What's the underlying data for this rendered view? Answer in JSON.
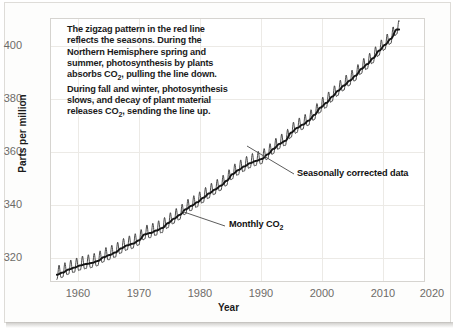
{
  "chart_data": {
    "type": "line",
    "title": "",
    "xlabel": "Year",
    "ylabel": "Parts per million",
    "xlim": [
      1957,
      2021
    ],
    "ylim": [
      312,
      408
    ],
    "xticks": [
      "1960",
      "1970",
      "1980",
      "1990",
      "2000",
      "2010",
      "2020"
    ],
    "yticks": [
      "320",
      "340",
      "360",
      "380",
      "400"
    ],
    "grid": true,
    "legend_position": "inline-annotations",
    "series": [
      {
        "name": "Monthly CO2",
        "description": "Monthly mean atmospheric CO2 with seasonal zigzag",
        "seasonal_amplitude_ppm": 6.5
      },
      {
        "name": "Seasonally corrected data",
        "description": "Seasonally adjusted trend line",
        "x": [
          1958,
          1959,
          1960,
          1961,
          1962,
          1963,
          1964,
          1965,
          1966,
          1967,
          1968,
          1969,
          1970,
          1971,
          1972,
          1973,
          1974,
          1975,
          1976,
          1977,
          1978,
          1979,
          1980,
          1981,
          1982,
          1983,
          1984,
          1985,
          1986,
          1987,
          1988,
          1989,
          1990,
          1991,
          1992,
          1993,
          1994,
          1995,
          1996,
          1997,
          1998,
          1999,
          2000,
          2001,
          2002,
          2003,
          2004,
          2005,
          2006,
          2007,
          2008,
          2009,
          2010,
          2011,
          2012,
          2013,
          2014,
          2015,
          2016
        ],
        "values": [
          315.0,
          315.8,
          316.9,
          317.6,
          318.4,
          318.9,
          319.3,
          320.0,
          321.4,
          322.2,
          323.1,
          324.6,
          325.7,
          326.3,
          327.5,
          329.7,
          330.2,
          331.1,
          332.0,
          333.8,
          335.4,
          336.8,
          338.8,
          340.1,
          341.4,
          343.0,
          344.6,
          346.0,
          347.4,
          349.2,
          351.6,
          353.1,
          354.4,
          355.6,
          356.4,
          357.1,
          358.8,
          360.8,
          362.6,
          363.7,
          366.7,
          368.4,
          369.6,
          371.1,
          373.2,
          375.8,
          377.5,
          379.8,
          381.9,
          383.8,
          385.6,
          387.4,
          389.9,
          391.6,
          393.8,
          396.5,
          398.6,
          400.8,
          404.2
        ]
      }
    ],
    "annotations": {
      "note": "The zigzag pattern in the red line reflects the seasons. During the Northern Hemisphere spring and summer, photosynthesis by plants absorbs CO₂, pulling the line down. During fall and winter, photosynthesis slows, and decay of plant material releases CO₂, sending the line up.",
      "seasonal_label": "Seasonally corrected data",
      "monthly_label_prefix": "Monthly CO",
      "monthly_label_sub": "2"
    }
  },
  "note_lines": [
    "The zigzag pattern in the red line",
    "reflects the seasons. During the",
    "Northern Hemisphere spring and",
    "summer, photosynthesis by plants",
    "absorbs CO₂, pulling the line down.",
    "During fall and winter, photosynthesis",
    "slows, and decay of plant material",
    "releases CO₂, sending the line up."
  ],
  "colors": {
    "monthly_line": "#2b2b2b",
    "trend_line": "#141414",
    "grid": "#eceae6",
    "frame": "#d6d4d0",
    "tick_text": "#6d6b68",
    "label_text": "#1b1b1b",
    "page_background": "#ffffff",
    "card_background": "#fdfdfc"
  }
}
